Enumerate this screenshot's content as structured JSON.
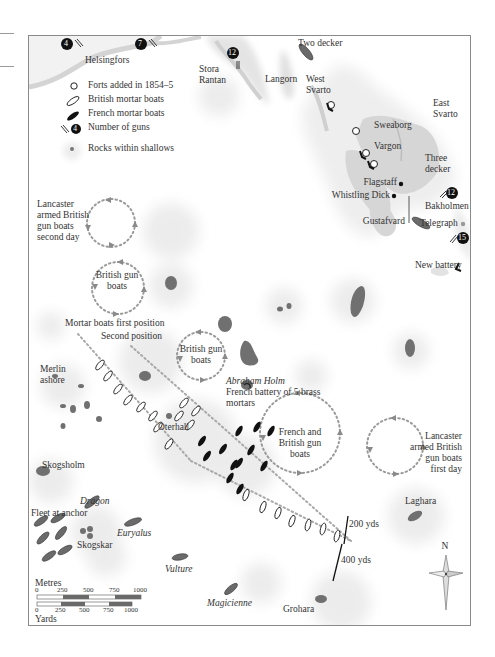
{
  "legend": {
    "forts": "Forts added in 1854–5",
    "british_mortar": "British mortar boats",
    "french_mortar": "French mortar boats",
    "guns": "Number of guns",
    "guns_example": "4",
    "rocks": "Rocks within shallows"
  },
  "places": {
    "helsingfors": "Helsingfors",
    "stora_rantan": "Stora Rantan",
    "langorn": "Langorn",
    "west_svarto": "West Svarto",
    "east_svarto": "East Svarto",
    "sweaborg": "Sweaborg",
    "vargon": "Vargon",
    "bakholmen": "Bakholmen",
    "gustafvard": "Gustafvard",
    "flagstaff": "Flagstaff",
    "whistling_dick": "Whistling Dick",
    "telegraph": "Telegraph",
    "new_battery": "New battery",
    "merlin": "Merlin ashore",
    "oterhall": "Oterhall",
    "skogsholm": "Skogsholm",
    "skogskar": "Skogskar",
    "laghara": "Laghara",
    "grohara": "Grohara",
    "abraham_holm": "Abraham Holm",
    "french_battery": "French battery of 5 brass mortars"
  },
  "ships": {
    "two_decker": "Two decker",
    "three_decker": "Three decker",
    "dragon": "Dragon",
    "euryalus": "Euryalus",
    "vulture": "Vulture",
    "magicienne": "Magicienne",
    "fleet": "Fleet at anchor"
  },
  "gun_counts": [
    "4",
    "7",
    "12",
    "12",
    "15"
  ],
  "annotations": {
    "lancaster_second": "Lancaster armed British gun boats second day",
    "british_gun_boats_1": "British gun boats",
    "british_gun_boats_2": "British gun boats",
    "french_british": "French and British gun boats",
    "lancaster_first": "Lancaster armed British gun boats first day",
    "mortar_first": "Mortar boats first position",
    "mortar_second": "Second position",
    "dist_200": "200 yds",
    "dist_400": "400 yds"
  },
  "compass": {
    "north": "N"
  },
  "scale": {
    "metres_label": "Metres",
    "yards_label": "Yards",
    "ticks": [
      "0",
      "250",
      "500",
      "750",
      "1000"
    ]
  },
  "colors": {
    "land": "#d9d9d9",
    "island_dark": "#6f6f6f",
    "shallows": "#ececec",
    "dotted_path": "#9a9a9a",
    "frame": "#8a8a8a"
  }
}
